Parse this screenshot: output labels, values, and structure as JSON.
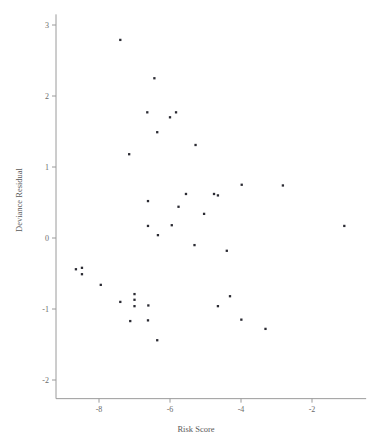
{
  "chart_data": {
    "type": "scatter",
    "title": "",
    "xlabel": "Risk Score",
    "ylabel": "Deviance Residual",
    "xlim": [
      -9.2,
      -0.7
    ],
    "ylim": [
      -2.15,
      3.15
    ],
    "xticks": [
      -8,
      -6,
      -4,
      -2
    ],
    "xticklabels": [
      "-8",
      "-6",
      "-4",
      "-2"
    ],
    "yticks": [
      -2,
      -1,
      0,
      1,
      2,
      3
    ],
    "yticklabels": [
      "-2",
      "-1",
      "0",
      "1",
      "2",
      "3"
    ],
    "grid": false,
    "legend": null,
    "marker": "square",
    "marker_color": "#2b2b33",
    "points": [
      {
        "x": -7.4,
        "y": 2.79
      },
      {
        "x": -6.44,
        "y": 2.25
      },
      {
        "x": -6.64,
        "y": 1.77
      },
      {
        "x": -6.0,
        "y": 1.7
      },
      {
        "x": -5.83,
        "y": 1.77
      },
      {
        "x": -6.36,
        "y": 1.49
      },
      {
        "x": -5.28,
        "y": 1.31
      },
      {
        "x": -7.15,
        "y": 1.18
      },
      {
        "x": -3.98,
        "y": 0.75
      },
      {
        "x": -2.82,
        "y": 0.74
      },
      {
        "x": -5.55,
        "y": 0.62
      },
      {
        "x": -4.76,
        "y": 0.62
      },
      {
        "x": -4.65,
        "y": 0.6
      },
      {
        "x": -6.62,
        "y": 0.52
      },
      {
        "x": -5.76,
        "y": 0.44
      },
      {
        "x": -5.04,
        "y": 0.34
      },
      {
        "x": -6.62,
        "y": 0.17
      },
      {
        "x": -5.95,
        "y": 0.18
      },
      {
        "x": -1.09,
        "y": 0.17
      },
      {
        "x": -6.34,
        "y": 0.04
      },
      {
        "x": -5.31,
        "y": -0.1
      },
      {
        "x": -4.4,
        "y": -0.18
      },
      {
        "x": -8.65,
        "y": -0.44
      },
      {
        "x": -8.48,
        "y": -0.42
      },
      {
        "x": -8.48,
        "y": -0.51
      },
      {
        "x": -7.95,
        "y": -0.66
      },
      {
        "x": -7.0,
        "y": -0.79
      },
      {
        "x": -7.0,
        "y": -0.87
      },
      {
        "x": -7.4,
        "y": -0.9
      },
      {
        "x": -4.31,
        "y": -0.82
      },
      {
        "x": -4.65,
        "y": -0.96
      },
      {
        "x": -7.0,
        "y": -0.96
      },
      {
        "x": -6.61,
        "y": -0.95
      },
      {
        "x": -7.12,
        "y": -1.17
      },
      {
        "x": -6.62,
        "y": -1.16
      },
      {
        "x": -3.99,
        "y": -1.15
      },
      {
        "x": -3.31,
        "y": -1.28
      },
      {
        "x": -6.36,
        "y": -1.44
      }
    ]
  }
}
